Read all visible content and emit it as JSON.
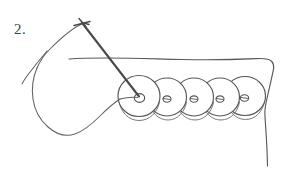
{
  "figure": {
    "step_label": "2.",
    "caption": "",
    "background_color": "#ffffff",
    "ink_color": "#4a4a4a",
    "ink_color_light": "#6e6e6e"
  },
  "canvas": {
    "width": 286,
    "height": 181
  },
  "fabric": {
    "name": "fabric-piece",
    "top_edge_label": "",
    "right_edge_label": ""
  },
  "needle": {
    "name": "sewing-needle",
    "tip_x": 82,
    "tip_y": 22,
    "entry_x": 139,
    "entry_y": 96
  },
  "thread": {
    "name": "thread-loop",
    "tail_x": 22,
    "tail_y": 84
  },
  "beads": {
    "count": 5,
    "items": [
      {
        "label": "bead-1",
        "cx": 139,
        "cy": 96,
        "r": 21
      },
      {
        "label": "bead-2",
        "cx": 167,
        "cy": 97,
        "r": 19
      },
      {
        "label": "bead-3",
        "cx": 194,
        "cy": 97,
        "r": 19
      },
      {
        "label": "bead-4",
        "cx": 220,
        "cy": 97,
        "r": 19
      },
      {
        "label": "bead-5",
        "cx": 245,
        "cy": 96,
        "r": 20
      }
    ]
  }
}
